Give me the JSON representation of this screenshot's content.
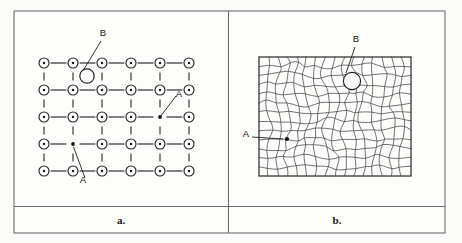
{
  "figure": {
    "background_color": "#fbfbfa",
    "border_color": "#6d6d70",
    "ink_color": "#1c1c1c"
  },
  "panels": [
    {
      "id": "panel-a",
      "caption": "a.",
      "description": "Regular square lattice of atoms with vacancy and interstitial defects",
      "lattice": {
        "columns": 6,
        "rows": 5,
        "atom_radius": 5.0,
        "core_radius": 1.25,
        "origin_x": 44,
        "origin_y": 63,
        "spacing_x": 29.0,
        "spacing_y": 27.0
      },
      "labels": [
        {
          "name": "B",
          "text": "B",
          "x": 103,
          "y": 36
        },
        {
          "name": "A-right",
          "text": "A",
          "x": 179,
          "y": 97
        },
        {
          "name": "A-lower",
          "text": "A",
          "x": 83,
          "y": 183
        }
      ],
      "defects": {
        "vacancies": [
          {
            "label": "A",
            "col": 5,
            "row": 3
          },
          {
            "label": "A",
            "col": 2,
            "row": 4
          }
        ],
        "interstitial_void": {
          "label": "B",
          "x": 87,
          "y": 76,
          "radius": 7.2
        }
      }
    },
    {
      "id": "panel-b",
      "caption": "b.",
      "description": "Strained, distorted lattice mesh containing the same defects",
      "mesh": {
        "x": 259,
        "y": 57,
        "width": 152,
        "height": 119,
        "columns": 16,
        "rows": 13,
        "distortion_amplitude": 3.4
      },
      "labels": [
        {
          "name": "B",
          "text": "B",
          "x": 356,
          "y": 42
        },
        {
          "name": "A",
          "text": "A",
          "x": 246,
          "y": 137
        }
      ],
      "defects": {
        "vacancy": {
          "label": "A",
          "x": 287,
          "y": 139,
          "radius": 2.1
        },
        "void": {
          "label": "B",
          "x": 352,
          "y": 81,
          "radius": 8.6
        }
      }
    }
  ]
}
